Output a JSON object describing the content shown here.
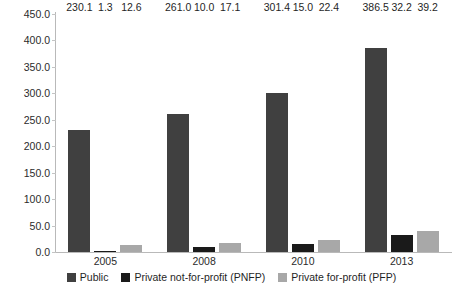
{
  "chart_data": {
    "type": "bar",
    "title": "",
    "subtitle": "",
    "xlabel": "",
    "ylabel": "",
    "categories": [
      "2005",
      "2008",
      "2010",
      "2013"
    ],
    "series": [
      {
        "name": "Public",
        "color": "#404040",
        "values": [
          230.1,
          261.0,
          301.4,
          386.5
        ],
        "labels": [
          "230.1",
          "261.0",
          "301.4",
          "386.5"
        ]
      },
      {
        "name": "Private not-for-profit (PNFP)",
        "color": "#1a1a1a",
        "values": [
          1.3,
          10.0,
          15.0,
          32.2
        ],
        "labels": [
          "1.3",
          "10.0",
          "15.0",
          "32.2"
        ]
      },
      {
        "name": "Private for-profit (PFP)",
        "color": "#a8a8a8",
        "values": [
          12.6,
          17.1,
          22.4,
          39.2
        ],
        "labels": [
          "12.6",
          "17.1",
          "22.4",
          "39.2"
        ]
      }
    ],
    "ylim": [
      0.0,
      450.0
    ],
    "ytick_step": 50.0,
    "yticks": [
      "0.0",
      "50.0",
      "100.0",
      "150.0",
      "200.0",
      "250.0",
      "300.0",
      "350.0",
      "400.0",
      "450.0"
    ],
    "grid": false,
    "legend_position": "bottom"
  },
  "legend": {
    "items": [
      {
        "label": "Public"
      },
      {
        "label": "Private not-for-profit (PNFP)"
      },
      {
        "label": "Private for-profit (PFP)"
      }
    ]
  }
}
